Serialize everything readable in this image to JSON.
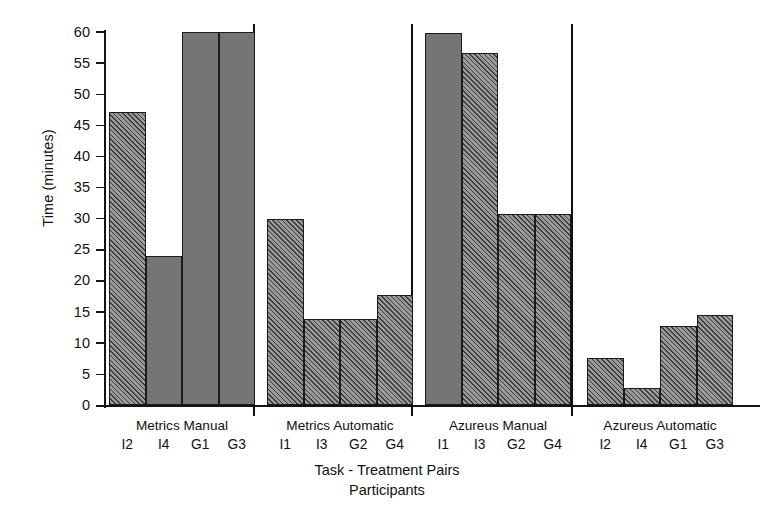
{
  "chart_data": {
    "type": "bar",
    "title": "",
    "xlabel": "Task - Treatment Pairs",
    "xlabel2": "Participants",
    "ylabel": "Time (minutes)",
    "ylim": [
      0,
      60
    ],
    "yticks": [
      0,
      5,
      10,
      15,
      20,
      25,
      30,
      35,
      40,
      45,
      50,
      55,
      60
    ],
    "ytick_labels": [
      "0",
      "5",
      "10",
      "15",
      "20",
      "25",
      "30",
      "35",
      "40",
      "45",
      "50",
      "55",
      "60"
    ],
    "grid": false,
    "legend": "none",
    "bar_fill_color": "#6e6e6e",
    "bar_edge_color": "#1b1b1b",
    "groups": [
      {
        "label": "Metrics Manual",
        "categories": [
          "I2",
          "I4",
          "G1",
          "G3"
        ],
        "values": [
          47.1,
          24.0,
          60.0,
          60.0
        ],
        "fills": [
          "hatch",
          "solid",
          "solid",
          "solid"
        ]
      },
      {
        "label": "Metrics Automatic",
        "categories": [
          "I1",
          "I3",
          "G2",
          "G4"
        ],
        "values": [
          30.0,
          13.9,
          13.9,
          17.7
        ],
        "fills": [
          "hatch",
          "hatch",
          "hatch",
          "hatch"
        ]
      },
      {
        "label": "Azureus Manual",
        "categories": [
          "I1",
          "I3",
          "G2",
          "G4"
        ],
        "values": [
          59.8,
          56.7,
          30.7,
          30.7
        ],
        "fills": [
          "solid",
          "hatch",
          "hatch",
          "hatch"
        ]
      },
      {
        "label": "Azureus Automatic",
        "categories": [
          "I2",
          "I4",
          "G1",
          "G3"
        ],
        "values": [
          7.7,
          2.8,
          12.7,
          14.6
        ],
        "fills": [
          "hatch",
          "hatch",
          "hatch",
          "hatch"
        ]
      }
    ]
  }
}
